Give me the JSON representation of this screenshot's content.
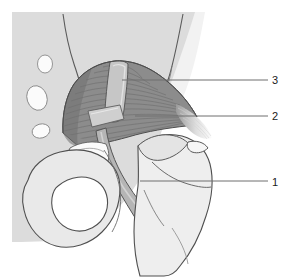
{
  "figure": {
    "kind": "anatomical-line-drawing",
    "width": 291,
    "height": 278,
    "background_color": "#ffffff",
    "plate_color": "#dcdcdc",
    "bone_fill": "#e8e8e8",
    "muscle_fill": "#8e8e8e",
    "nerve_fill": "#b8b8b8",
    "tendon_fill": "#f4f4f4",
    "outline_color": "#4a4a4a",
    "leader_color": "#6e6e6e"
  },
  "labels": [
    {
      "id": "3",
      "text": "3",
      "x": 274,
      "y": 84,
      "leader": {
        "x1": 122,
        "y1": 80,
        "x2": 268,
        "y2": 80
      }
    },
    {
      "id": "2",
      "text": "2",
      "x": 274,
      "y": 120,
      "leader": {
        "x1": 135,
        "y1": 116,
        "x2": 268,
        "y2": 116
      }
    },
    {
      "id": "1",
      "text": "1",
      "x": 274,
      "y": 186,
      "leader": {
        "x1": 140,
        "y1": 181,
        "x2": 268,
        "y2": 181
      }
    }
  ],
  "regions": {
    "sacral_plate": "sacrum-plate",
    "foramina": [
      "sacral-foramen-upper",
      "sacral-foramen-middle",
      "sacral-foramen-lower"
    ],
    "muscle": "piriformis-muscle",
    "nerve_vertical": "superior-gluteal-nerve-band",
    "nerve_descending": "sciatic-nerve-band",
    "nerve_patch": "inferior-gluteal-nerve-patch",
    "tendon": "piriformis-tendon-insertion",
    "obturator_foramen": "obturator-foramen",
    "femur": "femur-greater-trochanter",
    "ilium": "ilium-outline",
    "ischium": "ischium-outline",
    "sacrotuberous": "sacrotuberous-ligament-fibers"
  }
}
